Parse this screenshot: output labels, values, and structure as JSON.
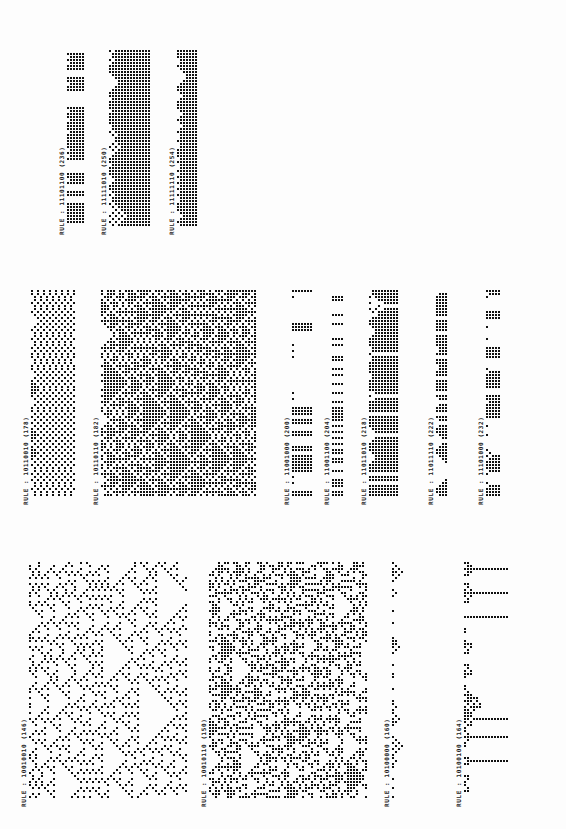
{
  "document": {
    "title": "Elementary cellular automaton rule evolutions (printout, rotated)",
    "label_prefix": "RULE :",
    "dot_color": "#111111",
    "background": "#fdfdfd"
  },
  "bands": [
    {
      "name": "top",
      "panels": [
        {
          "binary": "11101100",
          "decimal": 236,
          "label": "RULE : 11101100  (236)",
          "x": 58,
          "y": 50,
          "w": 28,
          "h": 185,
          "cells": 8
        },
        {
          "binary": "11111010",
          "decimal": 250,
          "label": "RULE : 11111010  (250)",
          "x": 100,
          "y": 50,
          "w": 52,
          "h": 185,
          "cells": 10
        },
        {
          "binary": "11111110",
          "decimal": 254,
          "label": "RULE : 11111110  (254)",
          "x": 168,
          "y": 50,
          "w": 30,
          "h": 185,
          "cells": 6
        }
      ]
    },
    {
      "name": "middle",
      "panels": [
        {
          "binary": "10110010",
          "decimal": 178,
          "label": "RULE : 10110010  (178)",
          "x": 22,
          "y": 290,
          "w": 56,
          "h": 215,
          "cells": 10
        },
        {
          "binary": "10110110",
          "decimal": 182,
          "label": "RULE : 10110110  (182)",
          "x": 92,
          "y": 290,
          "w": 166,
          "h": 215,
          "cells": 30
        },
        {
          "binary": "11001000",
          "decimal": 200,
          "label": "RULE : 11001000  (200)",
          "x": 283,
          "y": 290,
          "w": 30,
          "h": 215,
          "cells": 5
        },
        {
          "binary": "11001100",
          "decimal": 204,
          "label": "RULE : 11001100  (204)",
          "x": 323,
          "y": 290,
          "w": 22,
          "h": 215,
          "cells": 3
        },
        {
          "binary": "11011010",
          "decimal": 218,
          "label": "RULE : 11011010  (218)",
          "x": 360,
          "y": 290,
          "w": 40,
          "h": 215,
          "cells": 9
        },
        {
          "binary": "11011110",
          "decimal": 222,
          "label": "RULE : 11011110  (222)",
          "x": 427,
          "y": 290,
          "w": 22,
          "h": 215,
          "cells": 5
        },
        {
          "binary": "11101000",
          "decimal": 232,
          "label": "RULE : 11101000  (232)",
          "x": 477,
          "y": 290,
          "w": 24,
          "h": 215,
          "cells": 6
        }
      ]
    },
    {
      "name": "bottom",
      "panels": [
        {
          "binary": "10010010",
          "decimal": 146,
          "label": "RULE : 10010010  (146)",
          "x": 20,
          "y": 562,
          "w": 168,
          "h": 245,
          "cells": 26
        },
        {
          "binary": "10010110",
          "decimal": 150,
          "label": "RULE : 10010110  (150)",
          "x": 200,
          "y": 562,
          "w": 168,
          "h": 245,
          "cells": 26
        },
        {
          "binary": "10100000",
          "decimal": 160,
          "label": "RULE : 10100000  (160)",
          "x": 383,
          "y": 562,
          "w": 52,
          "h": 245,
          "cells": 10
        },
        {
          "binary": "10100100",
          "decimal": 164,
          "label": "RULE : 10100100  (164)",
          "x": 455,
          "y": 562,
          "w": 54,
          "h": 245,
          "cells": 10
        }
      ]
    }
  ]
}
